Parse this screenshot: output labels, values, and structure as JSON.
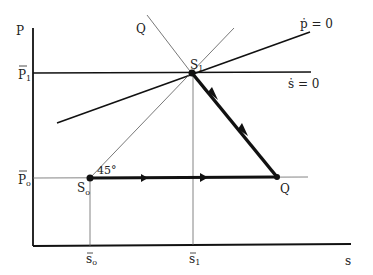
{
  "axes": {
    "y_label": "P",
    "x_label": "s"
  },
  "y_ticks": {
    "p1": {
      "main": "P",
      "sub": "1",
      "bar": true
    },
    "p0": {
      "main": "P",
      "sub": "o",
      "bar": true
    }
  },
  "x_ticks": {
    "s0": {
      "main": "s",
      "sub": "o",
      "bar": true
    },
    "s1": {
      "main": "s",
      "sub": "1",
      "bar": true
    }
  },
  "curves": {
    "p_dot_zero": "ṗ = 0",
    "s_dot_zero": "ṡ = 0",
    "q_line_label": "Q"
  },
  "points": {
    "s1": {
      "main": "S",
      "sub": "1"
    },
    "s0": {
      "main": "S",
      "sub": "o"
    },
    "q": "Q"
  },
  "angle_label": "45°",
  "colors": {
    "ink": "#111111",
    "thin": "#555555",
    "background": "#ffffff"
  }
}
